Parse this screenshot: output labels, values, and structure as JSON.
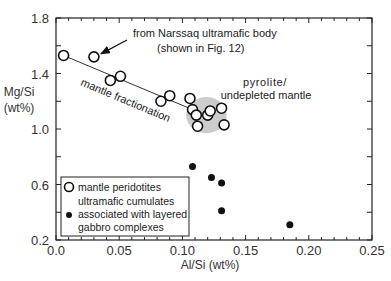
{
  "chart_data": {
    "type": "scatter",
    "title": "",
    "xlabel": "Al/Si (wt%)",
    "ylabel_lines": [
      "Mg/Si",
      "(wt%)"
    ],
    "xlim": [
      0.0,
      0.25
    ],
    "ylim": [
      0.2,
      1.8
    ],
    "x_ticks": [
      "0.0",
      "0.05",
      "0.10",
      "0.15",
      "0.20",
      "0.25"
    ],
    "x_tick_values": [
      0.0,
      0.05,
      0.1,
      0.15,
      0.2,
      0.25
    ],
    "x_minor_step": 0.01,
    "y_ticks": [
      "0.2",
      "0.6",
      "1.0",
      "1.4",
      "1.8"
    ],
    "y_tick_values": [
      0.2,
      0.6,
      1.0,
      1.4,
      1.8
    ],
    "y_minor_step": 0.2,
    "grid": false,
    "series": [
      {
        "name": "mantle peridotites",
        "marker": "open-circle",
        "points": [
          {
            "x": 0.006,
            "y": 1.53
          },
          {
            "x": 0.03,
            "y": 1.52
          },
          {
            "x": 0.043,
            "y": 1.35
          },
          {
            "x": 0.051,
            "y": 1.38
          },
          {
            "x": 0.083,
            "y": 1.2
          },
          {
            "x": 0.09,
            "y": 1.24
          },
          {
            "x": 0.106,
            "y": 1.22
          },
          {
            "x": 0.108,
            "y": 1.14
          },
          {
            "x": 0.111,
            "y": 1.1
          },
          {
            "x": 0.112,
            "y": 1.02
          },
          {
            "x": 0.12,
            "y": 1.1
          },
          {
            "x": 0.122,
            "y": 1.13
          },
          {
            "x": 0.131,
            "y": 1.15
          },
          {
            "x": 0.133,
            "y": 1.03
          }
        ]
      },
      {
        "name": "ultramafic cumulates associated with layered gabbro complexes",
        "marker": "filled-circle",
        "points": [
          {
            "x": 0.108,
            "y": 0.73
          },
          {
            "x": 0.123,
            "y": 0.65
          },
          {
            "x": 0.131,
            "y": 0.61
          },
          {
            "x": 0.131,
            "y": 0.41
          },
          {
            "x": 0.185,
            "y": 0.31
          }
        ]
      }
    ],
    "trend_line": {
      "label": "mantle fractionation",
      "from": {
        "x": 0.006,
        "y": 1.53
      },
      "to": {
        "x": 0.108,
        "y": 1.14
      }
    },
    "shaded_region": {
      "label_lines": [
        "pyrolite/",
        "undepleted mantle"
      ],
      "center": {
        "x": 0.119,
        "y": 1.1
      },
      "rx": 0.016,
      "ry": 0.13,
      "color": "#cccccc"
    },
    "annotations": [
      {
        "lines": [
          "from Narssaq ultramafic body",
          "(shown in Fig. 12)"
        ],
        "arrow_to": {
          "x": 0.03,
          "y": 1.52
        }
      }
    ],
    "legend": {
      "placement": "bottom-left",
      "entries": [
        {
          "marker": "open-circle",
          "lines": [
            "mantle peridotites"
          ]
        },
        {
          "marker": "filled-circle",
          "lines": [
            "ultramafic  cumulates",
            "associated with layered",
            "gabbro complexes"
          ]
        }
      ]
    }
  }
}
